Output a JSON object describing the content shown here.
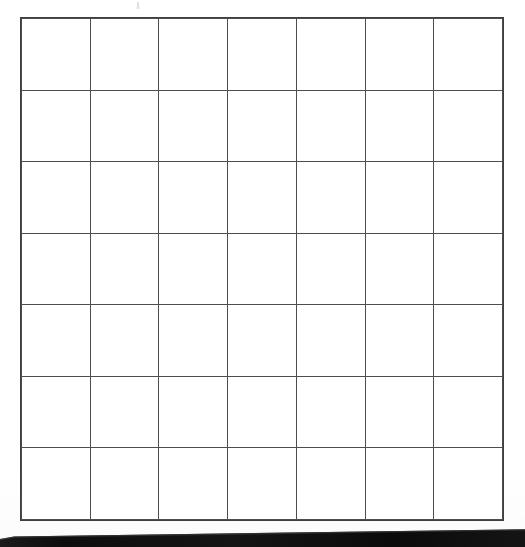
{
  "document": {
    "type": "scanned-worksheet",
    "title": "Blank grid worksheet",
    "background_color": "#ffffff",
    "page_width": 525,
    "page_height": 547
  },
  "grid": {
    "name": "blank-grid",
    "rows": 7,
    "columns": 7,
    "total_cells": 49,
    "line_color": "#4d4d4d",
    "line_width_px": 1,
    "cell_fill": "#ffffff",
    "cells_have_content": false,
    "bounds": {
      "left": 21,
      "top": 18,
      "right": 503,
      "bottom": 520,
      "width": 482,
      "height": 502
    },
    "cell_size": {
      "width": 68.9,
      "height": 71.7
    },
    "row_labels": [
      "",
      "",
      "",
      "",
      "",
      "",
      ""
    ],
    "column_labels": [
      "",
      "",
      "",
      "",
      "",
      "",
      ""
    ],
    "cell_values": [
      [
        "",
        "",
        "",
        "",
        "",
        "",
        ""
      ],
      [
        "",
        "",
        "",
        "",
        "",
        "",
        ""
      ],
      [
        "",
        "",
        "",
        "",
        "",
        "",
        ""
      ],
      [
        "",
        "",
        "",
        "",
        "",
        "",
        ""
      ],
      [
        "",
        "",
        "",
        "",
        "",
        "",
        ""
      ],
      [
        "",
        "",
        "",
        "",
        "",
        "",
        ""
      ],
      [
        "",
        "",
        "",
        "",
        "",
        "",
        ""
      ]
    ]
  },
  "artifacts": {
    "stray_mark": {
      "name": "stray-speck-mark",
      "x": 137,
      "y": 2,
      "color": "#d8d8d8",
      "description": "faint tick mark above grid"
    },
    "page_edge_bar": {
      "name": "page-edge-shadow-bar",
      "color": "#101010",
      "top_left_y": 537,
      "top_right_y": 530,
      "bottom_y": 547,
      "description": "black angled scanner edge bar along bottom"
    }
  }
}
